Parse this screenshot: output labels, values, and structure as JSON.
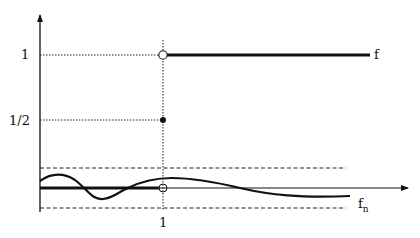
{
  "diagram": {
    "type": "function-convergence-plot",
    "y_axis": {
      "ticks": [
        {
          "label": "1",
          "value": 1
        },
        {
          "label": "1/2",
          "value": 0.5
        }
      ]
    },
    "x_axis": {
      "ticks": [
        {
          "label": "1",
          "value": 1
        }
      ]
    },
    "curves": {
      "f": {
        "label": "f",
        "description": "step function: 0 for x<1, 1/2 at x=1, 1 for x>1"
      },
      "fn": {
        "label": "f",
        "subscript": "n",
        "description": "oscillating function within a dashed epsilon-band around 0"
      }
    },
    "markers": [
      {
        "x": 1,
        "y": 1,
        "style": "open-circle"
      },
      {
        "x": 1,
        "y": 0.5,
        "style": "filled-circle"
      },
      {
        "x": 1,
        "y": 0,
        "style": "open-circle"
      }
    ],
    "colors": {
      "ink": "#111111",
      "background": "#ffffff"
    }
  }
}
